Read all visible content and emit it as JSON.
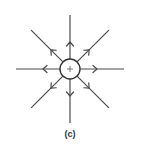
{
  "figure": {
    "label": "(c)",
    "charge_sign": "+",
    "field_lines": [
      {
        "direction": "up",
        "angle_deg": 90,
        "arrow": "outward"
      },
      {
        "direction": "up-right",
        "angle_deg": 45,
        "arrow": "outward"
      },
      {
        "direction": "right",
        "angle_deg": 0,
        "arrow": "outward"
      },
      {
        "direction": "down-right",
        "angle_deg": -45,
        "arrow": "outward"
      },
      {
        "direction": "down",
        "angle_deg": -90,
        "arrow": "outward"
      },
      {
        "direction": "down-left",
        "angle_deg": -135,
        "arrow": "outward"
      },
      {
        "direction": "left",
        "angle_deg": 180,
        "arrow": "outward"
      },
      {
        "direction": "up-left",
        "angle_deg": 135,
        "arrow": "outward"
      }
    ]
  }
}
